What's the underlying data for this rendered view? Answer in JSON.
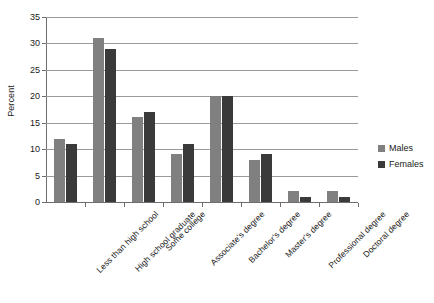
{
  "chart_data": {
    "type": "bar",
    "title": "",
    "xlabel": "",
    "ylabel": "Percent",
    "ylim": [
      0,
      35
    ],
    "ytick_step": 5,
    "yticks": [
      0,
      5,
      10,
      15,
      20,
      25,
      30,
      35
    ],
    "grid": true,
    "legend_position": "right",
    "categories": [
      "Less than high school",
      "High school graduate",
      "Some college",
      "Associate's degree",
      "Bachelor's degree",
      "Master's degree",
      "Professional degree",
      "Doctoral degree"
    ],
    "series": [
      {
        "name": "Males",
        "color": "#808080",
        "values": [
          12,
          31,
          16,
          9,
          20,
          8,
          2,
          2
        ]
      },
      {
        "name": "Females",
        "color": "#3a3a3a",
        "values": [
          11,
          29,
          17,
          11,
          20,
          9,
          1,
          1
        ]
      }
    ]
  }
}
